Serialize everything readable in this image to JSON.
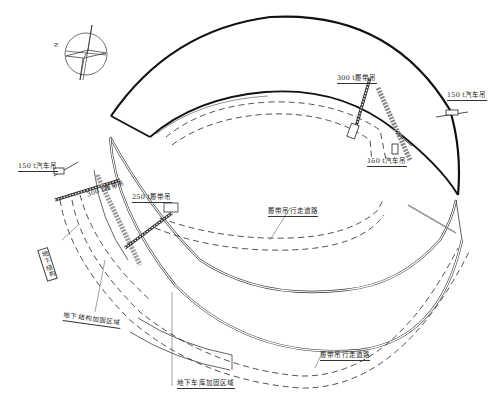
{
  "diagram": {
    "type": "construction-site-plan",
    "compass": {
      "label": "N"
    },
    "labels": {
      "crawler_300": "300 t履带吊",
      "truck_150_upper_right": "150 t汽车吊",
      "truck_150_upper_mid": "150 t汽车吊",
      "truck_150_left": "150 t汽车吊",
      "crawler_250": "250 t履带吊",
      "crawler_300_left": "300 t履带吊",
      "crawler_path_mid": "履带吊行走道路",
      "crawler_path_bottom": "履带吊行走道路",
      "underground_structure": "地下结构",
      "underground_structure_reinforce": "地下结构加固区域",
      "underground_garage_reinforce": "地下车库加固区域"
    },
    "colors": {
      "line": "#1a1a1a",
      "thick_line": "#111111",
      "light_line": "#777777",
      "background": "#ffffff"
    }
  }
}
